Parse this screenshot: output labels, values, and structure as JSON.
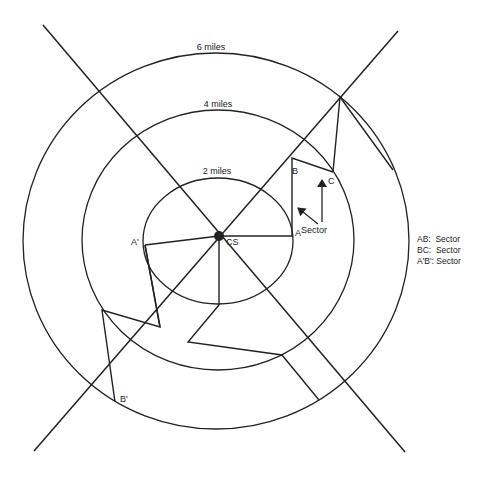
{
  "rings": [
    {
      "label": "6 miles",
      "cx": 216,
      "cy": 241,
      "rx": 193,
      "ry": 188,
      "label_x": 211,
      "label_y": 50
    },
    {
      "label": "4 miles",
      "cx": 218,
      "cy": 240,
      "rx": 136,
      "ry": 130,
      "label_x": 218,
      "label_y": 107
    },
    {
      "label": "2 miles",
      "cx": 218,
      "cy": 241,
      "rx": 75,
      "ry": 63,
      "label_x": 217,
      "label_y": 174
    }
  ],
  "axes": [
    {
      "x1": 43,
      "y1": 25,
      "x2": 405,
      "y2": 452
    },
    {
      "x1": 398,
      "y1": 31,
      "x2": 34,
      "y2": 451
    }
  ],
  "center": {
    "label": "CS",
    "x": 219,
    "y": 236,
    "r": 5
  },
  "points": {
    "A": {
      "label": "A",
      "x": 292,
      "y": 236
    },
    "B": {
      "label": "B",
      "x": 291,
      "y": 160
    },
    "C": {
      "label": "C",
      "x": 333,
      "y": 172
    },
    "A_prime": {
      "label": "A'",
      "x": 145,
      "y": 245
    },
    "B_prime": {
      "label": "B'",
      "x": 115,
      "y": 402
    }
  },
  "paths": [
    {
      "name": "ray-cs-a",
      "points": "219,236 292,236"
    },
    {
      "name": "ray-cs-a-prime",
      "points": "219,236 145,245"
    },
    {
      "name": "ray-cs-down",
      "points": "219,236 219,305"
    },
    {
      "name": "sector-ab",
      "points": "292,236 292,158 333,172"
    },
    {
      "name": "sector-bc",
      "points": "333,172 340,97 393,170"
    },
    {
      "name": "sector-a-prime-b-prime",
      "points": "145,245 160,327 102,310 115,402"
    },
    {
      "name": "lower-path",
      "points": "219,305 188,342 282,355 319,400"
    },
    {
      "name": "left-notch",
      "points": "145,245 160,327"
    }
  ],
  "annotations": {
    "sector_label": {
      "text": "Sector",
      "x": 301,
      "y": 233
    },
    "arrow_diag": {
      "x1": 318,
      "y1": 224,
      "x2": 298,
      "y2": 208
    },
    "arrow_up": {
      "x1": 322,
      "y1": 222,
      "x2": 322,
      "y2": 180
    }
  },
  "legend": [
    {
      "key": "AB:",
      "value": "Sector"
    },
    {
      "key": "BC:",
      "value": "Sector"
    },
    {
      "key": "A'B':",
      "value": "Sector"
    }
  ],
  "colors": {
    "stroke": "#222222",
    "background": "#ffffff"
  }
}
